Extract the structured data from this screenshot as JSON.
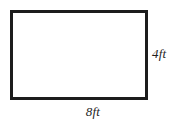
{
  "figure": {
    "type": "rectangle-diagram",
    "shape": {
      "name": "rectangle",
      "stroke_color": "#1c1c1c",
      "fill_color": "#ffffff"
    },
    "background_color": "#ffffff",
    "labels": {
      "right_side": "4ft",
      "bottom_side": "8ft"
    },
    "measurements": {
      "width_value": "8",
      "height_value": "4",
      "unit": "ft"
    }
  }
}
